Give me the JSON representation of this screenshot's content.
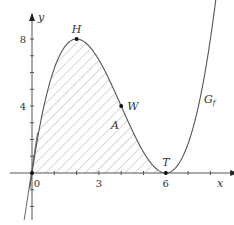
{
  "chart_data": {
    "type": "line",
    "title": "",
    "xlabel": "x",
    "ylabel": "y",
    "function": "f(x) = x(x-6)^2 / 4",
    "curve_label": "G_f",
    "xlim": [
      -1,
      9.2
    ],
    "ylim": [
      -2.8,
      9.5
    ],
    "x_ticks": [
      {
        "value": 0,
        "label": "0"
      },
      {
        "value": 3,
        "label": "3"
      },
      {
        "value": 6,
        "label": "6"
      }
    ],
    "y_ticks": [
      {
        "value": 4,
        "label": "4"
      },
      {
        "value": 8,
        "label": "8"
      }
    ],
    "x_minor_ticks": [
      1,
      2,
      3,
      4,
      5,
      6,
      7,
      8
    ],
    "y_minor_ticks": [
      -2,
      -1,
      1,
      2,
      3,
      4,
      5,
      6,
      7,
      8
    ],
    "points": [
      {
        "name": "H",
        "x": 2,
        "y": 8
      },
      {
        "name": "W",
        "x": 4,
        "y": 4
      },
      {
        "name": "T",
        "x": 6,
        "y": 0
      }
    ],
    "shaded_region": {
      "label": "A",
      "from_x": 0,
      "to_x": 6,
      "label_pos": {
        "x": 3,
        "y": 3
      }
    },
    "grid": false,
    "secondary_line": {
      "description": "steep line through origin",
      "points": [
        [
          -0.35,
          -2.8
        ],
        [
          0.25,
          2.4
        ]
      ]
    }
  }
}
